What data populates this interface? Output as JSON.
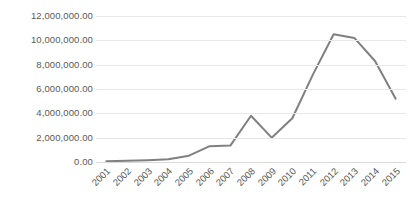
{
  "chart_data": {
    "type": "line",
    "title": "",
    "subtitle": "",
    "xlabel": "",
    "ylabel": "",
    "categories": [
      "2001",
      "2002",
      "2003",
      "2004",
      "2005",
      "2006",
      "2007",
      "2008",
      "2009",
      "2010",
      "2011",
      "2012",
      "2013",
      "2014",
      "2015"
    ],
    "values": [
      60000,
      100000,
      150000,
      220000,
      520000,
      1300000,
      1350000,
      3800000,
      2000000,
      3600000,
      7200000,
      10500000,
      10200000,
      8300000,
      5200000
    ],
    "series": [
      {
        "name": "",
        "values": [
          60000,
          100000,
          150000,
          220000,
          520000,
          1300000,
          1350000,
          3800000,
          2000000,
          3600000,
          7200000,
          10500000,
          10200000,
          8300000,
          5200000
        ]
      }
    ],
    "ylim": [
      0,
      12000000
    ],
    "ytick_values": [
      0,
      2000000,
      4000000,
      6000000,
      8000000,
      10000000,
      12000000
    ],
    "ytick_labels": [
      "0.00",
      "2,000,000.00",
      "4,000,000.00",
      "6,000,000.00",
      "8,000,000.00",
      "10,000,000.00",
      "12,000,000.00"
    ],
    "xtick_labels": [
      "2001",
      "2002",
      "2003",
      "2004",
      "2005",
      "2006",
      "2007",
      "2008",
      "2009",
      "2010",
      "2011",
      "2012",
      "2013",
      "2014",
      "2015"
    ],
    "grid": true,
    "grid_axis": "y",
    "legend": false,
    "legend_position": "none",
    "annotations": [],
    "colors": {
      "line": "#808080",
      "gridline": "#e8e8e8",
      "baseline": "#d9d9d9",
      "tick_text": "#595959",
      "background": "#ffffff"
    },
    "line_width": 2.0,
    "markers": false,
    "xtick_rotation": -45
  }
}
